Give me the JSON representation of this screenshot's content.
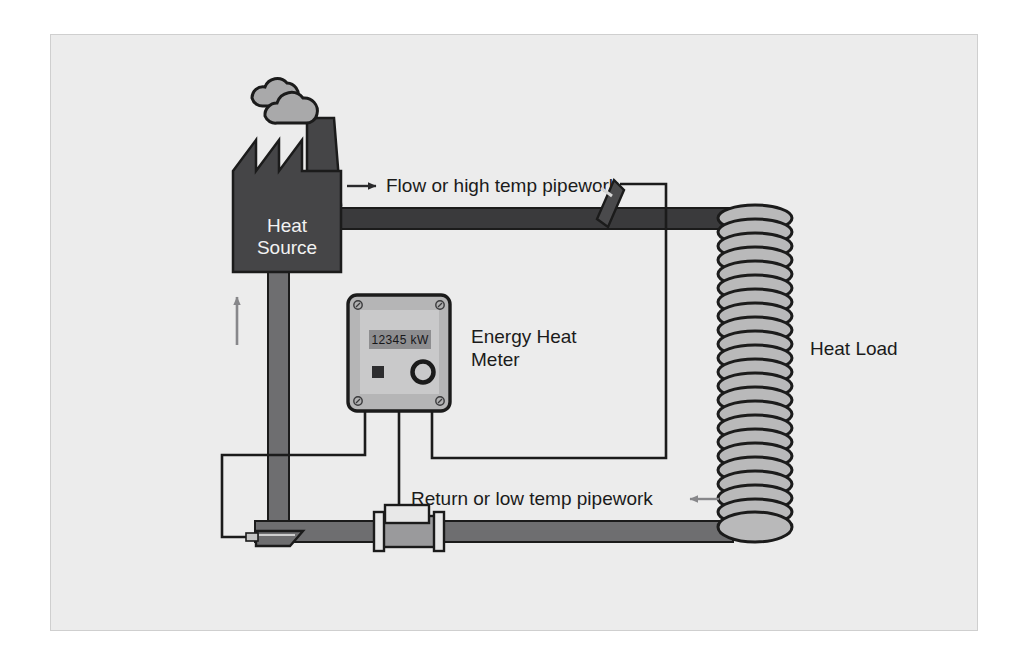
{
  "figure": {
    "background_color": "#ececec",
    "page_color": "#ffffff",
    "border_color": "#cfcfcf"
  },
  "colors": {
    "flow_pipe": "#3a3a3c",
    "return_pipe": "#6e6e70",
    "heat_source_fill": "#454547",
    "coil_fill": "#b9b9ba",
    "meter_body": "#b5b5b6",
    "meter_face": "#c9c9ca",
    "display_fill": "#8e8e90",
    "cloud_fill": "#a9a9aa",
    "outline": "#1b1b1b",
    "arrow_gray": "#87878a",
    "label_text": "#1b1b1b",
    "source_text": "#f2f2f2"
  },
  "labels": {
    "heat_source_line1": "Heat",
    "heat_source_line2": "Source",
    "flow_pipework": "Flow or high temp pipework",
    "return_pipework": "Return or low temp pipework",
    "energy_meter_line1": "Energy Heat",
    "energy_meter_line2": "Meter",
    "heat_load": "Heat Load"
  },
  "meter": {
    "display_value": "12345 kW",
    "display_units": "kW",
    "display_number": "12345",
    "screw_count": 4,
    "button_shape": "square",
    "dial_shape": "circle",
    "wire_count": 3
  },
  "heat_load": {
    "element": "coil",
    "coil_turns": 22
  },
  "heat_source": {
    "roof_peaks": 3,
    "has_chimney": true,
    "smoke_clouds": 2
  },
  "flow_circuit": {
    "direction_arrow": "right",
    "sensor": "temperature-probe-flow"
  },
  "return_circuit": {
    "direction_arrow": "left",
    "riser_arrow": "up",
    "sensor": "temperature-probe-return",
    "flow_meter": "inline-flow-meter"
  }
}
